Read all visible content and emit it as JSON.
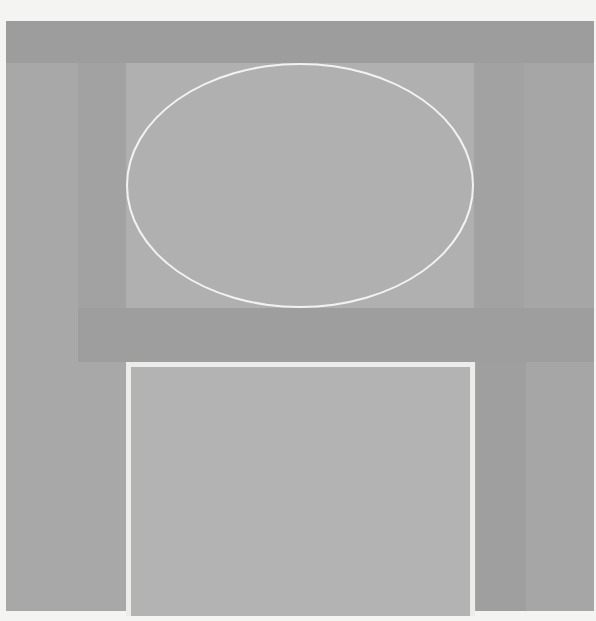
{
  "image": {
    "description": "Minimalist abstract painting in grayscale: an upper rectangle containing a white outlined ellipse above a lower rectangle outlined in white, set on layered gray fields",
    "colors": {
      "paper": "#f4f4f2",
      "field": "#a6a6a6",
      "dark_band": "#9d9d9d",
      "upper_panel": "#b0b0b0",
      "lower_panel": "#b3b3b3",
      "outline": "#f0f0ee"
    },
    "shapes": [
      {
        "type": "ellipse",
        "label": "white outlined ellipse"
      },
      {
        "type": "rectangle",
        "label": "white outlined square"
      }
    ]
  }
}
